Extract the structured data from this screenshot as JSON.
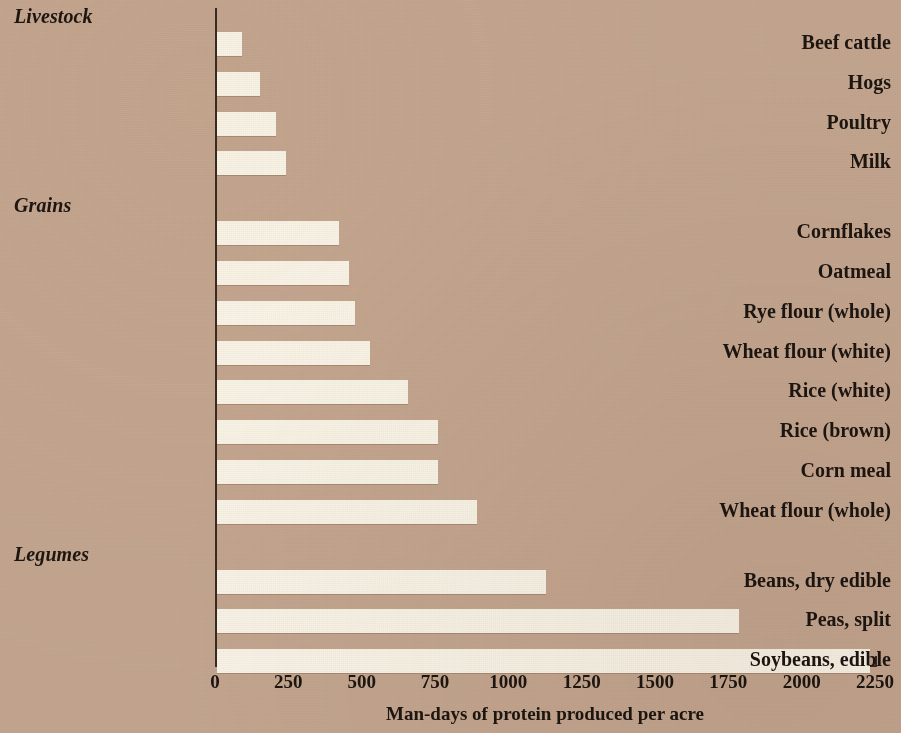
{
  "chart_data": {
    "type": "bar",
    "orientation": "horizontal",
    "title": "",
    "xlabel": "Man-days of protein produced per acre",
    "ylabel": "",
    "xlim": [
      0,
      2250
    ],
    "xticks": [
      0,
      250,
      500,
      750,
      1000,
      1250,
      1500,
      1750,
      2000,
      2250
    ],
    "xtick_labels": [
      "0",
      "250",
      "500",
      "750",
      "1000",
      "1250",
      "1500",
      "1750",
      "2000",
      "2250"
    ],
    "grid": false,
    "legend": null,
    "bar_color": "#f8f3e6",
    "background_color": "#c4a68f",
    "text_color": "#1d1510",
    "groups": [
      {
        "name": "Livestock",
        "categories": [
          "Beef cattle",
          "Hogs",
          "Poultry",
          "Milk"
        ],
        "values": [
          85,
          145,
          200,
          235
        ]
      },
      {
        "name": "Grains",
        "categories": [
          "Cornflakes",
          "Oatmeal",
          "Rye flour (whole)",
          "Wheat flour (white)",
          "Rice (white)",
          "Rice (brown)",
          "Corn meal",
          "Wheat flour (whole)"
        ],
        "values": [
          415,
          450,
          470,
          520,
          650,
          755,
          755,
          885
        ]
      },
      {
        "name": "Legumes",
        "categories": [
          "Beans, dry edible",
          "Peas, split",
          "Soybeans, edible"
        ],
        "values": [
          1120,
          1780,
          2225
        ]
      }
    ],
    "categories": [
      "Beef cattle",
      "Hogs",
      "Poultry",
      "Milk",
      "Cornflakes",
      "Oatmeal",
      "Rye flour (whole)",
      "Wheat flour (white)",
      "Rice (white)",
      "Rice (brown)",
      "Corn meal",
      "Wheat flour (whole)",
      "Beans, dry edible",
      "Peas, split",
      "Soybeans, edible"
    ],
    "values": [
      85,
      145,
      200,
      235,
      415,
      450,
      470,
      520,
      650,
      755,
      755,
      885,
      1120,
      1780,
      2225
    ]
  }
}
